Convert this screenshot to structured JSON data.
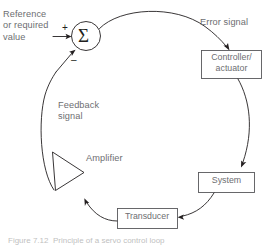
{
  "figure": {
    "type": "block-diagram",
    "caption": "Figure 7.12  Principle of a servo control loop"
  },
  "labels": {
    "reference": "Reference\nor required\nvalue",
    "error_signal": "Error signal",
    "feedback_signal": "Feedback\nsignal",
    "amplifier": "Amplifier",
    "plus_sign": "+",
    "minus_sign": "–",
    "summing_symbol": "Σ"
  },
  "blocks": [
    {
      "id": "summing-junction",
      "shape": "circle",
      "label": "Σ"
    },
    {
      "id": "controller-actuator",
      "shape": "rectangle",
      "label": "Controller/\nactuator"
    },
    {
      "id": "system",
      "shape": "rectangle",
      "label": "System"
    },
    {
      "id": "transducer",
      "shape": "rectangle",
      "label": "Transducer"
    },
    {
      "id": "amplifier",
      "shape": "triangle",
      "label": "Amplifier"
    }
  ],
  "connections": [
    {
      "from": "reference-input",
      "to": "summing-junction",
      "label": "+",
      "style": "arrow-straight"
    },
    {
      "from": "summing-junction",
      "to": "controller-actuator",
      "label": "Error signal",
      "style": "arc"
    },
    {
      "from": "controller-actuator",
      "to": "system",
      "label": "",
      "style": "arc"
    },
    {
      "from": "system",
      "to": "transducer",
      "label": "",
      "style": "arc"
    },
    {
      "from": "transducer",
      "to": "amplifier",
      "label": "",
      "style": "arc"
    },
    {
      "from": "amplifier",
      "to": "summing-junction",
      "label": "Feedback\nsignal",
      "style": "arc"
    }
  ],
  "colors": {
    "line": "#231f20",
    "box_stroke": "#58585b",
    "text": "#6d6e71",
    "background": "#ffffff"
  }
}
